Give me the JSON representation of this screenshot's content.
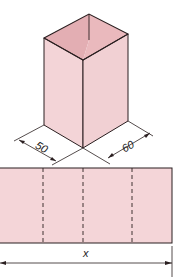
{
  "figure": {
    "type": "isometric box and net strip",
    "colors": {
      "face_light": "#f2d3d6",
      "face_top": "#e0a7ad",
      "face_inner": "#e9b9be",
      "stroke": "#2a1f20",
      "strip_fill": "#f4d5d8"
    },
    "box": {
      "dim_width_label": "50",
      "dim_depth_label": "60"
    },
    "net": {
      "fold_lines": 3,
      "length_label": "x"
    }
  }
}
